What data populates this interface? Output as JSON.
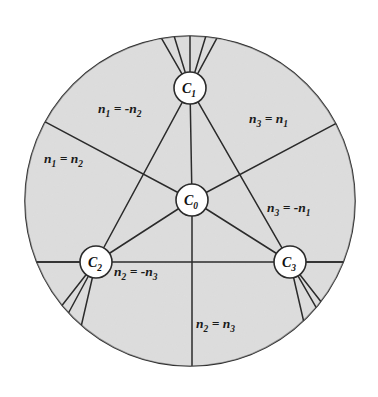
{
  "figure": {
    "type": "diagram",
    "colors": {
      "disc_fill": "#e3e3e3",
      "stroke": "#2b2b2b",
      "node_fill": "#ffffff",
      "text": "#1a1a1a",
      "background": "#ffffff"
    },
    "disc": {
      "cx": 190,
      "cy": 201,
      "r": 165
    },
    "nodes": [
      {
        "id": "C0",
        "base": "C",
        "sub": "0",
        "cx": 192,
        "cy": 200,
        "r": 16,
        "label": "C0"
      },
      {
        "id": "C1",
        "base": "C",
        "sub": "1",
        "cx": 190,
        "cy": 88,
        "r": 16,
        "label": "C1"
      },
      {
        "id": "C2",
        "base": "C",
        "sub": "2",
        "cx": 96,
        "cy": 262,
        "r": 16,
        "label": "C2"
      },
      {
        "id": "C3",
        "base": "C",
        "sub": "3",
        "cx": 290,
        "cy": 262,
        "r": 16,
        "label": "C3"
      }
    ],
    "region_labels": [
      {
        "id": "n1-eq-neg-n2",
        "text": "n1 = -n2",
        "parts": [
          "n",
          "1",
          " = -",
          "n",
          "2"
        ],
        "x": 98,
        "y": 113,
        "anchor": "start"
      },
      {
        "id": "n3-eq-n1",
        "text": "n3 = n1",
        "parts": [
          "n",
          "3",
          " = ",
          "n",
          "1"
        ],
        "x": 249,
        "y": 123,
        "anchor": "start"
      },
      {
        "id": "n1-eq-n2",
        "text": "n1 = n2",
        "parts": [
          "n",
          "1",
          " = ",
          "n",
          "2"
        ],
        "x": 44,
        "y": 163,
        "anchor": "start"
      },
      {
        "id": "n3-eq-neg-n1",
        "text": "n3 = -n1",
        "parts": [
          "n",
          "3",
          " = -",
          "n",
          "1"
        ],
        "x": 267,
        "y": 212,
        "anchor": "start"
      },
      {
        "id": "n2-eq-neg-n3",
        "text": "n2 = -n3",
        "parts": [
          "n",
          "2",
          " = -",
          "n",
          "3"
        ],
        "x": 114,
        "y": 276,
        "anchor": "start"
      },
      {
        "id": "n2-eq-n3",
        "text": "n2 = n3",
        "parts": [
          "n",
          "2",
          " = ",
          "n",
          "3"
        ],
        "x": 196,
        "y": 328,
        "anchor": "start"
      }
    ],
    "edges": [
      {
        "id": "c0-c1",
        "from": "C0",
        "to": "C1"
      },
      {
        "id": "c0-c2",
        "from": "C0",
        "to": "C2"
      },
      {
        "id": "c0-c3",
        "from": "C0",
        "to": "C3"
      },
      {
        "id": "c1-c2",
        "from": "C1",
        "to": "C2"
      },
      {
        "id": "c1-c3",
        "from": "C1",
        "to": "C3"
      },
      {
        "id": "c2-c3",
        "from": "C2",
        "to": "C3"
      }
    ],
    "spokes": [
      {
        "id": "c1-up-left",
        "node": "C1",
        "angle_deg": 253
      },
      {
        "id": "c1-up",
        "node": "C1",
        "angle_deg": 270
      },
      {
        "id": "c1-up-right",
        "node": "C1",
        "angle_deg": 287
      },
      {
        "id": "c2-left",
        "node": "C2",
        "angle_deg": 180
      },
      {
        "id": "c2-down-left",
        "node": "C2",
        "angle_deg": 128
      },
      {
        "id": "c2-down",
        "node": "C2",
        "angle_deg": 103
      },
      {
        "id": "c3-right",
        "node": "C3",
        "angle_deg": 0
      },
      {
        "id": "c3-down-right",
        "node": "C3",
        "angle_deg": 52
      },
      {
        "id": "c3-down",
        "node": "C3",
        "angle_deg": 77
      },
      {
        "id": "c0-down",
        "node": "C0",
        "angle_deg": 90
      },
      {
        "id": "c0-up-left-ext",
        "node": "C0",
        "angle_deg": 208
      },
      {
        "id": "c0-up-right-ext",
        "node": "C0",
        "angle_deg": 332
      }
    ]
  }
}
